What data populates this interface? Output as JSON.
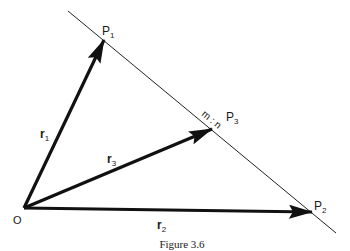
{
  "figure": {
    "caption": "Figure 3.6",
    "colors": {
      "stroke": "#111111",
      "background": "#ffffff"
    },
    "origin": {
      "label": "O",
      "x": 24,
      "y": 208
    },
    "line": {
      "x1": 68,
      "y1": 11,
      "x2": 336,
      "y2": 233
    },
    "points": [
      {
        "id": "P1",
        "label": "P",
        "subscript": "1",
        "x": 104,
        "y": 40
      },
      {
        "id": "P2",
        "label": "P",
        "subscript": "2",
        "x": 312,
        "y": 212
      },
      {
        "id": "P3",
        "label": "P",
        "subscript": "3",
        "x": 212,
        "y": 129
      }
    ],
    "vectors": [
      {
        "id": "r1",
        "label": "r",
        "subscript": "1",
        "from": "O",
        "to": "P1"
      },
      {
        "id": "r2",
        "label": "r",
        "subscript": "2",
        "from": "O",
        "to": "P2"
      },
      {
        "id": "r3",
        "label": "r",
        "subscript": "3",
        "from": "O",
        "to": "P3"
      }
    ],
    "ratio_label": "m : n"
  }
}
